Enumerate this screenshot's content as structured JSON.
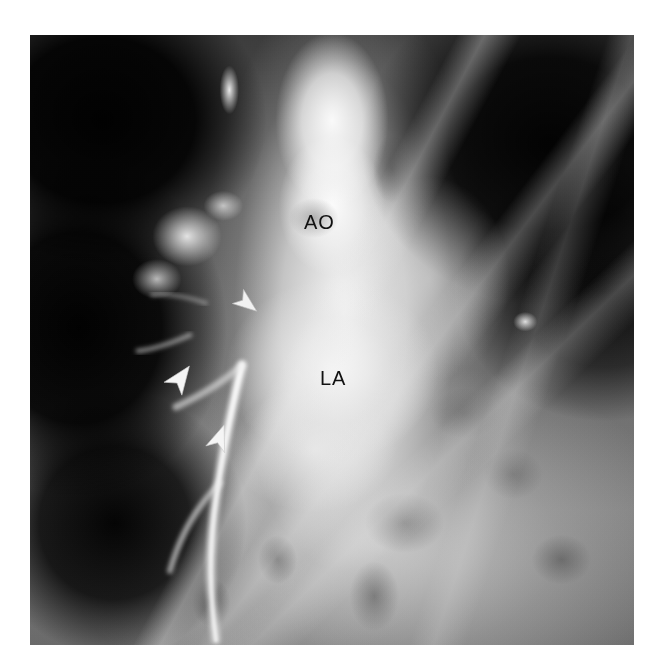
{
  "image": {
    "kind": "radiograph",
    "modality": "angiocardiogram",
    "view": "frontal-chest",
    "colorspace": "grayscale",
    "background_color": "#ffffff",
    "film_bounds": {
      "x": 30,
      "y": 35,
      "width": 604,
      "height": 610
    },
    "tone": {
      "darkest": "#050505",
      "mid": "#6e6e6e",
      "brightest": "#fdfdfd"
    }
  },
  "annotations": {
    "text_color": "#111111",
    "labels": [
      {
        "id": "ao",
        "text": "AO",
        "meaning": "aorta",
        "x": 274,
        "y": 177
      },
      {
        "id": "la",
        "text": "LA",
        "meaning": "left atrium",
        "x": 290,
        "y": 333
      }
    ],
    "arrows": [
      {
        "id": "arrow-1",
        "color": "#f2f2f2",
        "direction": "down-left",
        "rotation_deg": 128,
        "x": 198,
        "y": 250
      },
      {
        "id": "arrow-2",
        "color": "#f5f5f5",
        "direction": "up-right",
        "rotation_deg": 36,
        "x": 133,
        "y": 327
      },
      {
        "id": "arrow-3",
        "color": "#f5f5f5",
        "direction": "up-right",
        "rotation_deg": 20,
        "x": 172,
        "y": 387
      }
    ]
  },
  "anatomy": {
    "structures": [
      "aorta",
      "left atrium",
      "left lung field",
      "right lung field",
      "pulmonary vasculature",
      "descending vessel"
    ]
  }
}
